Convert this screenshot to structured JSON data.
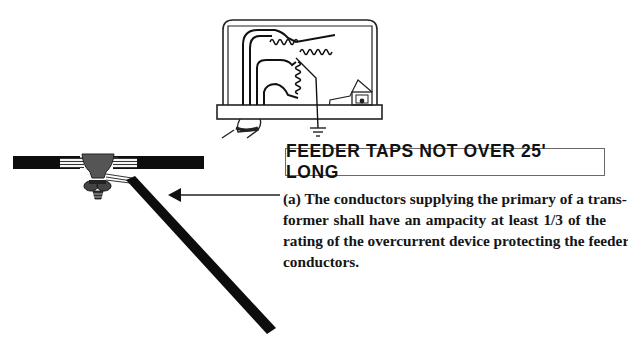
{
  "heading": {
    "title": "FEEDER TAPS NOT OVER 25' LONG"
  },
  "rule_text": {
    "lines": [
      "(a) The conductors supplying the primary of a trans-",
      "former shall have an ampacity at least 1/3 of the",
      "rating of the overcurrent device protecting the feeder",
      "conductors."
    ]
  },
  "illustration": {
    "transformer": "transformer-enclosure-with-windings",
    "ground_symbol": "ground-icon",
    "feeder": "feeder-conductor-with-tap-connector",
    "tap_conductor": "tap-conductor",
    "pointer": "arrow-left-icon"
  },
  "colors": {
    "ink": "#111111",
    "connector_gray": "#555555",
    "frame_gray": "#6a6a6a",
    "background": "#ffffff"
  }
}
